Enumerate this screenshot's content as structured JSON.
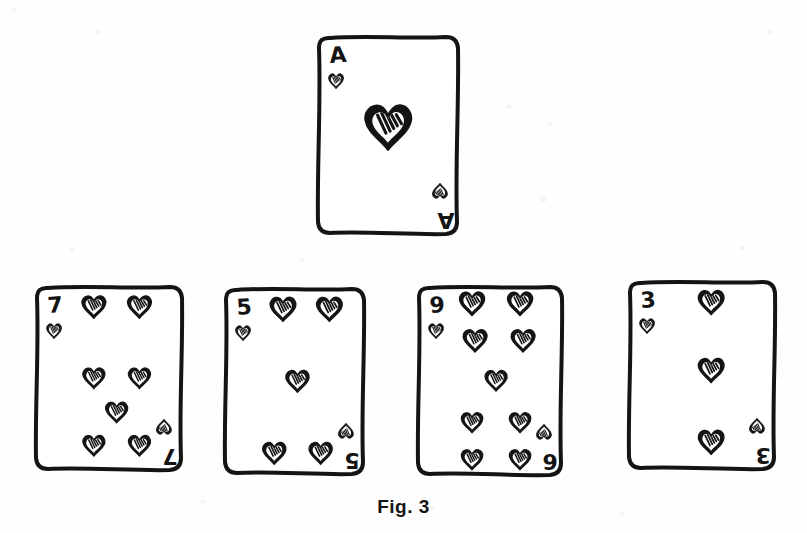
{
  "figure": {
    "caption": "Fig. 3",
    "caption_position": {
      "x": 0,
      "y": 496
    },
    "canvas": {
      "width": 807,
      "height": 533
    },
    "style": {
      "ink_color": "#141414",
      "paper_color": "#ffffff",
      "background_color": "#fefefe",
      "stroke_width": 4
    }
  },
  "cards": [
    {
      "id": "card-ace-hearts",
      "name": "ace-of-hearts",
      "rank": "A",
      "rank_bottom": "A",
      "suit": "hearts",
      "suit_symbol": "♥",
      "row": "top",
      "pip_count": 1,
      "x": 315,
      "y": 33,
      "width": 146,
      "height": 204,
      "pips": [
        {
          "x": 0.5,
          "y": 0.46,
          "size": 1.0,
          "flip": false
        }
      ],
      "corner_index": {
        "top_left": "A",
        "bottom_right": "A"
      }
    },
    {
      "id": "card-7-hearts",
      "name": "seven-of-hearts",
      "rank": "7",
      "rank_bottom": "7",
      "suit": "hearts",
      "suit_symbol": "♥",
      "row": "bottom",
      "pip_count": 7,
      "x": 33,
      "y": 283,
      "width": 152,
      "height": 190,
      "pips": [
        {
          "x": 0.4,
          "y": 0.125,
          "size": 0.8,
          "flip": false
        },
        {
          "x": 0.7,
          "y": 0.125,
          "size": 0.8,
          "flip": false
        },
        {
          "x": 0.4,
          "y": 0.5,
          "size": 0.74,
          "flip": false
        },
        {
          "x": 0.7,
          "y": 0.5,
          "size": 0.74,
          "flip": false
        },
        {
          "x": 0.55,
          "y": 0.68,
          "size": 0.74,
          "flip": false
        },
        {
          "x": 0.4,
          "y": 0.855,
          "size": 0.74,
          "flip": false
        },
        {
          "x": 0.7,
          "y": 0.855,
          "size": 0.74,
          "flip": false
        }
      ],
      "corner_index": {
        "top_left": "7",
        "bottom_right": "7"
      }
    },
    {
      "id": "card-5-hearts",
      "name": "five-of-hearts",
      "rank": "5",
      "rank_bottom": "5",
      "suit": "hearts",
      "suit_symbol": "♥",
      "row": "bottom",
      "pip_count": 5,
      "x": 222,
      "y": 285,
      "width": 145,
      "height": 192,
      "pips": [
        {
          "x": 0.42,
          "y": 0.125,
          "size": 0.86,
          "flip": false
        },
        {
          "x": 0.74,
          "y": 0.125,
          "size": 0.86,
          "flip": false
        },
        {
          "x": 0.52,
          "y": 0.5,
          "size": 0.78,
          "flip": false
        },
        {
          "x": 0.36,
          "y": 0.875,
          "size": 0.78,
          "flip": false
        },
        {
          "x": 0.68,
          "y": 0.875,
          "size": 0.78,
          "flip": false
        }
      ],
      "corner_index": {
        "top_left": "5",
        "bottom_right": "5"
      }
    },
    {
      "id": "card-9-hearts",
      "name": "nine-of-hearts",
      "rank": "9",
      "rank_bottom": "6",
      "suit": "hearts",
      "suit_symbol": "♥",
      "row": "bottom",
      "pip_count": 9,
      "x": 415,
      "y": 283,
      "width": 150,
      "height": 195,
      "pips": [
        {
          "x": 0.38,
          "y": 0.105,
          "size": 0.84,
          "flip": false
        },
        {
          "x": 0.7,
          "y": 0.105,
          "size": 0.84,
          "flip": false
        },
        {
          "x": 0.4,
          "y": 0.295,
          "size": 0.8,
          "flip": false
        },
        {
          "x": 0.72,
          "y": 0.295,
          "size": 0.8,
          "flip": false
        },
        {
          "x": 0.54,
          "y": 0.5,
          "size": 0.74,
          "flip": false
        },
        {
          "x": 0.38,
          "y": 0.715,
          "size": 0.72,
          "flip": false
        },
        {
          "x": 0.7,
          "y": 0.715,
          "size": 0.72,
          "flip": false
        },
        {
          "x": 0.38,
          "y": 0.905,
          "size": 0.72,
          "flip": false
        },
        {
          "x": 0.7,
          "y": 0.905,
          "size": 0.72,
          "flip": false
        }
      ],
      "corner_index": {
        "top_left": "9",
        "bottom_right": "6"
      }
    },
    {
      "id": "card-3-hearts",
      "name": "three-of-hearts",
      "rank": "3",
      "rank_bottom": "3",
      "suit": "hearts",
      "suit_symbol": "♥",
      "row": "bottom",
      "pip_count": 3,
      "x": 626,
      "y": 278,
      "width": 152,
      "height": 194,
      "pips": [
        {
          "x": 0.56,
          "y": 0.125,
          "size": 0.86,
          "flip": false
        },
        {
          "x": 0.56,
          "y": 0.475,
          "size": 0.86,
          "flip": false
        },
        {
          "x": 0.56,
          "y": 0.845,
          "size": 0.86,
          "flip": false
        }
      ],
      "corner_index": {
        "top_left": "3",
        "bottom_right": "3"
      }
    }
  ]
}
